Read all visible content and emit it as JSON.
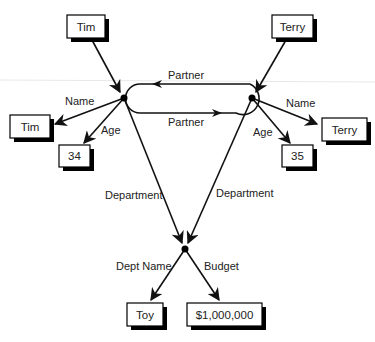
{
  "diagram": {
    "type": "semantic-network",
    "nodes": {
      "tim_entity": {
        "label": "Tim"
      },
      "terry_entity": {
        "label": "Terry"
      },
      "tim_name": {
        "label": "Tim"
      },
      "tim_age": {
        "label": "34"
      },
      "terry_name": {
        "label": "Terry"
      },
      "terry_age": {
        "label": "35"
      },
      "dept_name": {
        "label": "Toy"
      },
      "dept_budget": {
        "label": "$1,000,000"
      }
    },
    "edges": {
      "partner_top": "Partner",
      "partner_bottom": "Partner",
      "tim_name": "Name",
      "tim_age": "Age",
      "terry_name": "Name",
      "terry_age": "Age",
      "tim_department": "Department",
      "terry_department": "Department",
      "dept_name": "Dept Name",
      "budget": "Budget"
    }
  }
}
